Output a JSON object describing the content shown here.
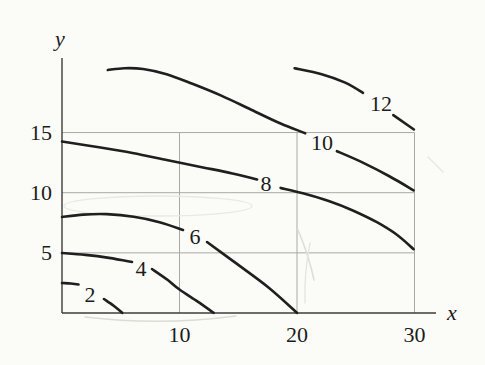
{
  "palette": {
    "paper": "#fbfbf8",
    "ink": "#1f1f1f",
    "axis": "#3c3c3c",
    "grid": "#a9a9a4"
  },
  "chart_data": {
    "type": "contour",
    "title": "",
    "xlabel": "x",
    "ylabel": "y",
    "xlim": [
      0,
      31.8
    ],
    "ylim": [
      0,
      21.2
    ],
    "x_ticks": [
      10,
      20,
      30
    ],
    "y_ticks": [
      5,
      10,
      15
    ],
    "grid": true,
    "legend_position": "none",
    "levels": [
      2,
      4,
      6,
      8,
      10,
      12
    ],
    "contours": [
      {
        "level": 2,
        "label": "2",
        "label_at": [
          2.38,
          1.5
        ],
        "segments": [
          [
            [
              0,
              2.49
            ],
            [
              0.75,
              2.45
            ],
            [
              1.4,
              2.37
            ]
          ],
          [
            [
              3.57,
              1.16
            ],
            [
              4.4,
              0.6
            ],
            [
              5.12,
              0.02
            ]
          ]
        ]
      },
      {
        "level": 4,
        "label": "4",
        "label_at": [
          6.72,
          3.74
        ],
        "segments": [
          [
            [
              0,
              4.99
            ],
            [
              2.0,
              4.83
            ],
            [
              4.0,
              4.58
            ],
            [
              5.96,
              4.24
            ]
          ],
          [
            [
              7.66,
              3.66
            ],
            [
              9.0,
              2.74
            ],
            [
              10.0,
              1.95
            ],
            [
              11.55,
              0.95
            ],
            [
              12.9,
              0.02
            ]
          ]
        ]
      },
      {
        "level": 6,
        "label": "6",
        "label_at": [
          11.32,
          6.32
        ],
        "segments": [
          [
            [
              0,
              7.98
            ],
            [
              1.8,
              8.18
            ],
            [
              3.8,
              8.22
            ],
            [
              6.1,
              8.0
            ],
            [
              8.3,
              7.55
            ],
            [
              10.3,
              6.9
            ]
          ],
          [
            [
              12.34,
              5.9
            ],
            [
              15.0,
              4.0
            ],
            [
              17.6,
              2.1
            ],
            [
              20.0,
              0.02
            ]
          ]
        ]
      },
      {
        "level": 8,
        "label": "8",
        "label_at": [
          17.36,
          10.75
        ],
        "segments": [
          [
            [
              0,
              14.26
            ],
            [
              3.0,
              13.8
            ],
            [
              6.0,
              13.3
            ],
            [
              9.0,
              12.7
            ],
            [
              12.0,
              12.1
            ],
            [
              14.5,
              11.6
            ],
            [
              16.6,
              11.1
            ]
          ],
          [
            [
              18.6,
              10.4
            ],
            [
              20.5,
              9.95
            ],
            [
              22.7,
              9.3
            ],
            [
              24.8,
              8.5
            ],
            [
              26.8,
              7.55
            ],
            [
              28.5,
              6.5
            ],
            [
              29.92,
              5.3
            ]
          ]
        ]
      },
      {
        "level": 10,
        "label": "10",
        "label_at": [
          22.13,
          14.2
        ],
        "segments": [
          [
            [
              3.9,
              20.2
            ],
            [
              5.3,
              20.35
            ],
            [
              6.9,
              20.28
            ],
            [
              8.9,
              19.85
            ],
            [
              11.1,
              19.05
            ],
            [
              13.6,
              18.05
            ],
            [
              16.1,
              16.9
            ],
            [
              18.6,
              15.75
            ],
            [
              20.7,
              14.95
            ]
          ],
          [
            [
              23.4,
              13.45
            ],
            [
              25.6,
              12.5
            ],
            [
              27.9,
              11.35
            ],
            [
              29.92,
              10.2
            ]
          ]
        ]
      },
      {
        "level": 12,
        "label": "12",
        "label_at": [
          27.15,
          17.45
        ],
        "segments": [
          [
            [
              19.8,
              20.35
            ],
            [
              22.1,
              19.85
            ],
            [
              24.1,
              19.15
            ],
            [
              25.62,
              18.3
            ]
          ],
          [
            [
              28.2,
              16.45
            ],
            [
              29.95,
              15.25
            ]
          ]
        ]
      }
    ]
  }
}
